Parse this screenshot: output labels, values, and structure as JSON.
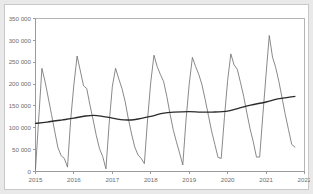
{
  "chart_data": {
    "type": "line",
    "title": "",
    "subtitle": "",
    "xlabel": "",
    "ylabel": "",
    "xlim": [
      2015.0,
      2022.0
    ],
    "ylim": [
      0,
      350000
    ],
    "grid": false,
    "legend": "none",
    "y_ticks": [
      0,
      50000,
      100000,
      150000,
      200000,
      250000,
      300000,
      350000
    ],
    "y_tick_labels": [
      "0",
      "50 000",
      "100 000",
      "150 000",
      "200 000",
      "250 000",
      "300 000",
      "350 000"
    ],
    "x_ticks": [
      2015,
      2016,
      2017,
      2018,
      2019,
      2020,
      2021,
      2022
    ],
    "x_tick_labels": [
      "2015",
      "2016",
      "2017",
      "2018",
      "2019",
      "2020",
      "2021",
      "2022"
    ],
    "series": [
      {
        "name": "monthly-series",
        "color": "#6b6b6b",
        "x": [
          2015.0,
          2015.083,
          2015.167,
          2015.25,
          2015.333,
          2015.417,
          2015.5,
          2015.583,
          2015.667,
          2015.75,
          2015.833,
          2015.917,
          2016.0,
          2016.083,
          2016.167,
          2016.25,
          2016.333,
          2016.417,
          2016.5,
          2016.583,
          2016.667,
          2016.75,
          2016.833,
          2016.917,
          2017.0,
          2017.083,
          2017.167,
          2017.25,
          2017.333,
          2017.417,
          2017.5,
          2017.583,
          2017.667,
          2017.75,
          2017.833,
          2017.917,
          2018.0,
          2018.083,
          2018.167,
          2018.25,
          2018.333,
          2018.417,
          2018.5,
          2018.583,
          2018.667,
          2018.75,
          2018.833,
          2018.917,
          2019.0,
          2019.083,
          2019.167,
          2019.25,
          2019.333,
          2019.417,
          2019.5,
          2019.583,
          2019.667,
          2019.75,
          2019.833,
          2019.917,
          2020.0,
          2020.083,
          2020.167,
          2020.25,
          2020.333,
          2020.417,
          2020.5,
          2020.583,
          2020.667,
          2020.75,
          2020.833,
          2020.917,
          2021.0,
          2021.083,
          2021.167,
          2021.25,
          2021.333,
          2021.417,
          2021.5,
          2021.583,
          2021.667,
          2021.75
        ],
        "values": [
          5000,
          120000,
          236000,
          205000,
          168000,
          130000,
          92000,
          55000,
          36000,
          30000,
          10000,
          120000,
          200000,
          264000,
          230000,
          196000,
          190000,
          152000,
          118000,
          82000,
          52000,
          34000,
          6000,
          110000,
          195000,
          236000,
          212000,
          190000,
          160000,
          120000,
          86000,
          56000,
          38000,
          30000,
          18000,
          120000,
          205000,
          266000,
          240000,
          222000,
          206000,
          172000,
          132000,
          96000,
          68000,
          42000,
          15000,
          118000,
          200000,
          261000,
          240000,
          222000,
          198000,
          164000,
          128000,
          92000,
          62000,
          32000,
          30000,
          124000,
          208000,
          269000,
          244000,
          234000,
          204000,
          172000,
          134000,
          98000,
          68000,
          33000,
          33000,
          130000,
          222000,
          311000,
          262000,
          238000,
          206000,
          168000,
          130000,
          96000,
          62000,
          56000
        ]
      },
      {
        "name": "trend-series",
        "color": "#2b2b2b",
        "x": [
          2015.0,
          2015.3,
          2015.7,
          2016.0,
          2016.3,
          2016.6,
          2017.0,
          2017.3,
          2017.6,
          2018.0,
          2018.3,
          2018.6,
          2019.0,
          2019.3,
          2019.6,
          2020.0,
          2020.3,
          2020.6,
          2021.0,
          2021.3,
          2021.75
        ],
        "values": [
          110000,
          113000,
          118000,
          122000,
          127000,
          128000,
          122000,
          118000,
          119000,
          126000,
          133000,
          136000,
          137000,
          136000,
          136000,
          138000,
          145000,
          152000,
          159000,
          166000,
          172000
        ]
      }
    ]
  }
}
